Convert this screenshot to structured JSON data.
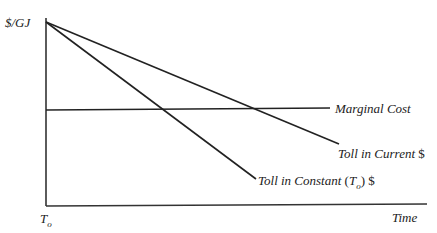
{
  "diagram": {
    "y_axis_label": "$/GJ",
    "x_axis_label": "Time",
    "origin_label_main": "T",
    "origin_label_sub": "o",
    "lines": [
      {
        "name": "Marginal Cost",
        "label": "Marginal Cost"
      },
      {
        "name": "Toll in Current $",
        "label_italic": "Toll in Current",
        "label_suffix": "$"
      },
      {
        "name": "Toll in Constant (To) $",
        "label_italic": "Toll in Constant",
        "label_paren_open": "(",
        "label_T": "T",
        "label_sub": "o",
        "label_paren_close": ")",
        "label_suffix": "$"
      }
    ],
    "colors": {
      "line": "#222222",
      "axis": "#333333",
      "background": "#ffffff"
    }
  }
}
